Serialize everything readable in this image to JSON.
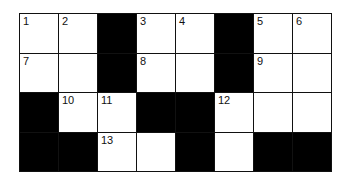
{
  "crossword": {
    "rows": 4,
    "cols": 8,
    "colors": {
      "white": "#ffffff",
      "black": "#000000",
      "line": "#111111"
    },
    "cells": [
      [
        {
          "type": "white",
          "number": "1"
        },
        {
          "type": "white",
          "number": "2"
        },
        {
          "type": "black"
        },
        {
          "type": "white",
          "number": "3"
        },
        {
          "type": "white",
          "number": "4"
        },
        {
          "type": "black"
        },
        {
          "type": "white",
          "number": "5"
        },
        {
          "type": "white",
          "number": "6"
        }
      ],
      [
        {
          "type": "white",
          "number": "7"
        },
        {
          "type": "white"
        },
        {
          "type": "black"
        },
        {
          "type": "white",
          "number": "8"
        },
        {
          "type": "white"
        },
        {
          "type": "black"
        },
        {
          "type": "white",
          "number": "9"
        },
        {
          "type": "white"
        }
      ],
      [
        {
          "type": "black"
        },
        {
          "type": "white",
          "number": "10"
        },
        {
          "type": "white",
          "number": "11"
        },
        {
          "type": "black"
        },
        {
          "type": "black"
        },
        {
          "type": "white",
          "number": "12"
        },
        {
          "type": "white"
        },
        {
          "type": "white"
        }
      ],
      [
        {
          "type": "black"
        },
        {
          "type": "black"
        },
        {
          "type": "white",
          "number": "13"
        },
        {
          "type": "white"
        },
        {
          "type": "black"
        },
        {
          "type": "white"
        },
        {
          "type": "black"
        },
        {
          "type": "black"
        }
      ]
    ]
  }
}
